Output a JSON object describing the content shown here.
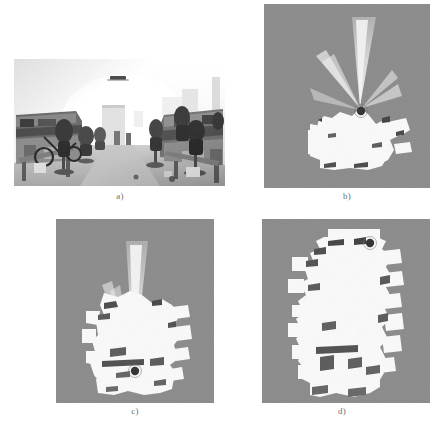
{
  "figure": {
    "type": "multi-panel-figure",
    "panel_count": 4,
    "background_color": "#ffffff"
  },
  "panels": [
    {
      "id": "a",
      "caption": "a)",
      "kind": "photograph",
      "description": "Grayscale indoor office corridor photograph with desks, office chairs and ceiling lights",
      "bounds": {
        "x": 14,
        "y": 59,
        "width": 211,
        "height": 127
      }
    },
    {
      "id": "b",
      "caption": "b)",
      "kind": "occupancy-grid-map",
      "description": "Partial occupancy grid map, early exploration stage with laser ray fan extending upward",
      "bounds": {
        "x": 264,
        "y": 4,
        "width": 166,
        "height": 184
      }
    },
    {
      "id": "c",
      "caption": "c)",
      "kind": "occupancy-grid-map",
      "description": "Intermediate occupancy grid map, corridor partially explored with robot mid-corridor",
      "bounds": {
        "x": 56,
        "y": 219,
        "width": 158,
        "height": 184
      }
    },
    {
      "id": "d",
      "caption": "d)",
      "kind": "occupancy-grid-map",
      "description": "Complete occupancy grid map of the full corridor, robot located at the top",
      "bounds": {
        "x": 262,
        "y": 219,
        "width": 168,
        "height": 184
      }
    }
  ],
  "map_legend": {
    "unknown_color": "#8a8a8a",
    "free_color": "#fbfbfb",
    "occupied_color": "#2b2b2b",
    "robot_marker_color": "#3a3a3a",
    "ray_fan_color": "#d8d8d8"
  },
  "captions": {
    "a": "a)",
    "b": "b)",
    "c": "c)",
    "d": "d)"
  }
}
